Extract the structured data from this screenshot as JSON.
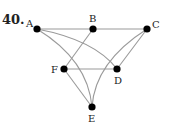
{
  "problem": {
    "number": "40."
  },
  "graph": {
    "colors": {
      "edge": "#9a9a9a",
      "node": "#000000",
      "text": "#222222"
    },
    "nodes": [
      {
        "id": "A",
        "label": "A",
        "x": 37,
        "y": 29,
        "lx": 26,
        "ly": 27
      },
      {
        "id": "B",
        "label": "B",
        "x": 93,
        "y": 29,
        "lx": 89,
        "ly": 22
      },
      {
        "id": "C",
        "label": "C",
        "x": 147,
        "y": 29,
        "lx": 152,
        "ly": 28
      },
      {
        "id": "F",
        "label": "F",
        "x": 64,
        "y": 69,
        "lx": 51,
        "ly": 73
      },
      {
        "id": "D",
        "label": "D",
        "x": 117,
        "y": 69,
        "lx": 114,
        "ly": 84
      },
      {
        "id": "E",
        "label": "E",
        "x": 92,
        "y": 107,
        "lx": 88,
        "ly": 122
      }
    ],
    "edges": [
      {
        "from": "A",
        "to": "B",
        "type": "straight"
      },
      {
        "from": "B",
        "to": "C",
        "type": "straight"
      },
      {
        "from": "B",
        "to": "F",
        "type": "straight"
      },
      {
        "from": "A",
        "to": "D",
        "type": "curve"
      },
      {
        "from": "A",
        "to": "E",
        "type": "curve"
      },
      {
        "from": "F",
        "to": "D",
        "type": "straight"
      },
      {
        "from": "F",
        "to": "E",
        "type": "straight"
      },
      {
        "from": "C",
        "to": "D",
        "type": "straight"
      },
      {
        "from": "C",
        "to": "E",
        "type": "curve"
      }
    ]
  }
}
